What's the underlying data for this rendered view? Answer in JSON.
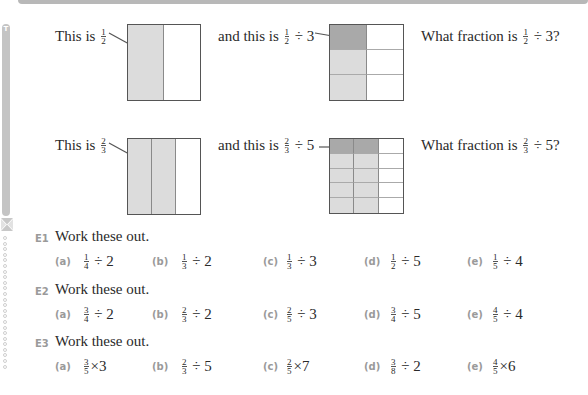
{
  "intro": {
    "row1": {
      "left": {
        "prefix": "This is",
        "num": "1",
        "den": "2"
      },
      "middle": {
        "prefix": "and this is",
        "num": "1",
        "den": "2",
        "op": "÷ 3"
      },
      "right": {
        "prefix": "What fraction is",
        "num": "1",
        "den": "2",
        "op": "÷ 3?"
      }
    },
    "row2": {
      "left": {
        "prefix": "This is",
        "num": "2",
        "den": "3"
      },
      "middle": {
        "prefix": "and this is",
        "num": "2",
        "den": "3",
        "op": "÷ 5"
      },
      "right": {
        "prefix": "What fraction is",
        "num": "2",
        "den": "3",
        "op": "÷ 5?"
      }
    }
  },
  "diagrams": {
    "box1": {
      "cols": 2,
      "rows": 1,
      "shaded_light": [
        [
          0,
          0
        ]
      ],
      "shaded_dark": []
    },
    "box2": {
      "cols": 2,
      "rows": 3,
      "shaded_light": [
        [
          1,
          0
        ],
        [
          2,
          0
        ]
      ],
      "shaded_dark": [
        [
          0,
          0
        ]
      ]
    },
    "box3": {
      "cols": 3,
      "rows": 1,
      "shaded_light": [
        [
          0,
          0
        ],
        [
          0,
          1
        ]
      ],
      "shaded_dark": []
    },
    "box4": {
      "cols": 3,
      "rows": 5,
      "shaded_light": [
        [
          1,
          0
        ],
        [
          1,
          1
        ],
        [
          2,
          0
        ],
        [
          2,
          1
        ],
        [
          3,
          0
        ],
        [
          3,
          1
        ],
        [
          4,
          0
        ],
        [
          4,
          1
        ]
      ],
      "shaded_dark": [
        [
          0,
          0
        ],
        [
          0,
          1
        ]
      ]
    }
  },
  "colors": {
    "light_shade": "#dcdcdc",
    "dark_shade": "#a9a9a9",
    "label_grey": "#9a9a9a",
    "border": "#555555"
  },
  "sidebar": {
    "tab_letter": "T"
  },
  "exercises": [
    {
      "number": "E1",
      "instruction": "Work these out.",
      "items": [
        {
          "label": "(a)",
          "num": "1",
          "den": "4",
          "op": "÷ 2"
        },
        {
          "label": "(b)",
          "num": "1",
          "den": "3",
          "op": "÷ 2"
        },
        {
          "label": "(c)",
          "num": "1",
          "den": "3",
          "op": "÷ 3"
        },
        {
          "label": "(d)",
          "num": "1",
          "den": "2",
          "op": "÷ 5"
        },
        {
          "label": "(e)",
          "num": "1",
          "den": "5",
          "op": "÷ 4"
        }
      ]
    },
    {
      "number": "E2",
      "instruction": "Work these out.",
      "items": [
        {
          "label": "(a)",
          "num": "3",
          "den": "4",
          "op": "÷ 2"
        },
        {
          "label": "(b)",
          "num": "2",
          "den": "3",
          "op": "÷ 2"
        },
        {
          "label": "(c)",
          "num": "2",
          "den": "5",
          "op": "÷ 3"
        },
        {
          "label": "(d)",
          "num": "3",
          "den": "4",
          "op": "÷ 5"
        },
        {
          "label": "(e)",
          "num": "4",
          "den": "5",
          "op": "÷ 4"
        }
      ]
    },
    {
      "number": "E3",
      "instruction": "Work these out.",
      "items": [
        {
          "label": "(a)",
          "num": "3",
          "den": "5",
          "op": "×3"
        },
        {
          "label": "(b)",
          "num": "2",
          "den": "3",
          "op": "÷ 5"
        },
        {
          "label": "(c)",
          "num": "2",
          "den": "5",
          "op": "×7"
        },
        {
          "label": "(d)",
          "num": "3",
          "den": "8",
          "op": "÷ 2"
        },
        {
          "label": "(e)",
          "num": "4",
          "den": "5",
          "op": "×6"
        }
      ]
    }
  ]
}
